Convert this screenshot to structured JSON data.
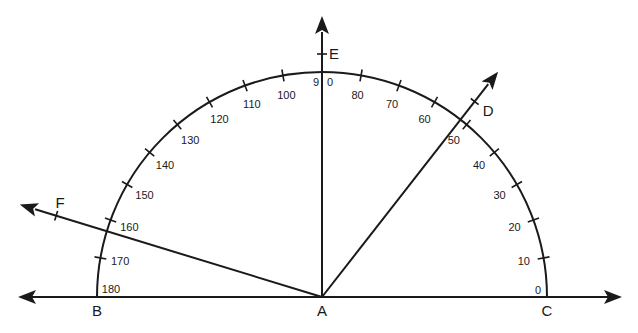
{
  "diagram": {
    "type": "protractor",
    "title": "",
    "stroke_color": "#1a1a1a",
    "scale": {
      "min_degrees": 0,
      "max_degrees": 180,
      "major_step": 10,
      "tick_labels": [
        "0",
        "10",
        "20",
        "30",
        "40",
        "50",
        "60",
        "70",
        "80",
        "90",
        "100",
        "110",
        "120",
        "130",
        "140",
        "150",
        "160",
        "170",
        "180"
      ]
    },
    "vertex": {
      "name": "A",
      "label": "A"
    },
    "baseline_points": [
      {
        "name": "B",
        "label": "B",
        "angle_degrees": 180
      },
      {
        "name": "C",
        "label": "C",
        "angle_degrees": 0
      }
    ],
    "rays": [
      {
        "name": "D",
        "label": "D",
        "angle_degrees": 52
      },
      {
        "name": "E",
        "label": "E",
        "angle_degrees": 90
      },
      {
        "name": "F",
        "label": "F",
        "angle_degrees": 163
      }
    ],
    "baseline": {
      "description": "line BC through A with arrows at both ends"
    }
  }
}
